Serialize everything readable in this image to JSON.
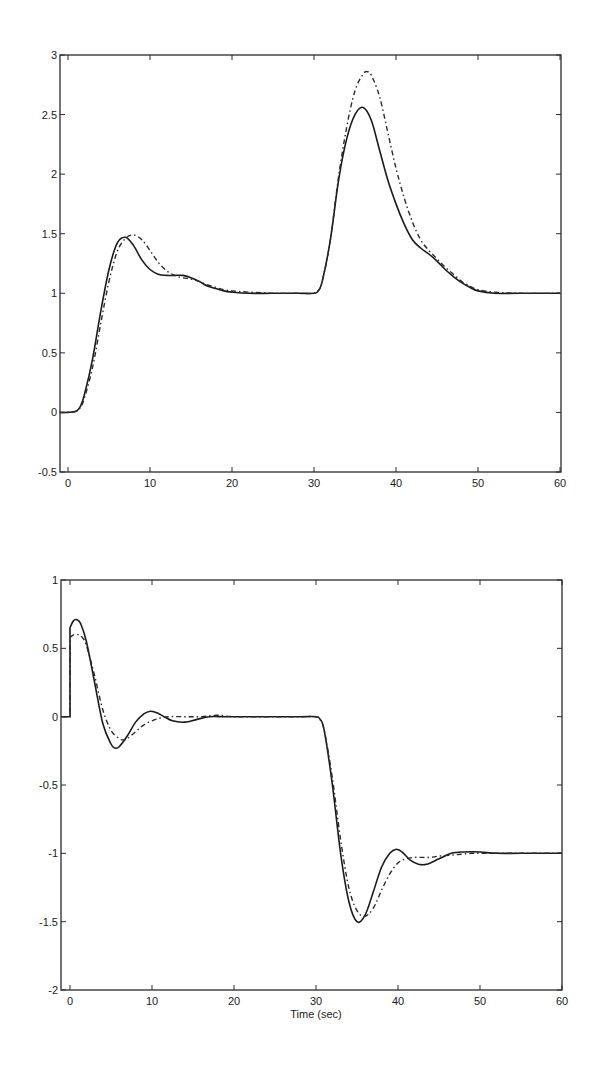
{
  "chart_data": [
    {
      "type": "line",
      "title": "",
      "xlabel": "",
      "ylabel": "",
      "xlim": [
        -1,
        60
      ],
      "ylim": [
        -0.5,
        3
      ],
      "grid": false,
      "legend": null,
      "x_ticks": [
        0,
        10,
        20,
        30,
        40,
        50,
        60
      ],
      "x_tick_labels": [
        "0",
        "10",
        "20",
        "30",
        "40",
        "50",
        "60"
      ],
      "y_ticks": [
        -0.5,
        0,
        0.5,
        1,
        1.5,
        2,
        2.5,
        3
      ],
      "y_tick_labels": [
        "-0.5",
        "0",
        "0.5",
        "1",
        "1.5",
        "2",
        "2.5",
        "3"
      ],
      "series": [
        {
          "name": "solid",
          "style": "solid",
          "x": [
            -1,
            0,
            1,
            1.5,
            2,
            3,
            4,
            5,
            6,
            7,
            8,
            9,
            10,
            11,
            12,
            13,
            14,
            15,
            16,
            17,
            18,
            19,
            20,
            22,
            25,
            28,
            30,
            30.5,
            31,
            32,
            33,
            34,
            35,
            36,
            37,
            38,
            39,
            40,
            41,
            42,
            43,
            44,
            45,
            46,
            47,
            48,
            49,
            50,
            52,
            55,
            60
          ],
          "y": [
            0,
            0,
            0.01,
            0.05,
            0.15,
            0.45,
            0.85,
            1.2,
            1.42,
            1.47,
            1.4,
            1.28,
            1.2,
            1.16,
            1.15,
            1.15,
            1.15,
            1.13,
            1.1,
            1.06,
            1.04,
            1.02,
            1.01,
            1.0,
            1.0,
            1.0,
            1.0,
            1.02,
            1.1,
            1.45,
            1.95,
            2.3,
            2.5,
            2.56,
            2.45,
            2.2,
            1.95,
            1.75,
            1.58,
            1.45,
            1.38,
            1.33,
            1.27,
            1.2,
            1.14,
            1.09,
            1.05,
            1.02,
            1.0,
            1.0,
            1.0
          ]
        },
        {
          "name": "dash-dot",
          "style": "dashed",
          "x": [
            -1,
            0,
            1,
            1.5,
            2,
            3,
            4,
            5,
            6,
            7,
            8,
            9,
            10,
            11,
            12,
            13,
            14,
            15,
            16,
            17,
            18,
            19,
            20,
            22,
            25,
            28,
            30,
            30.5,
            31,
            32,
            33,
            34,
            35,
            36,
            36.5,
            37,
            38,
            39,
            40,
            41,
            42,
            43,
            44,
            45,
            46,
            47,
            48,
            49,
            50,
            52,
            55,
            60
          ],
          "y": [
            0,
            0,
            0.01,
            0.04,
            0.12,
            0.38,
            0.75,
            1.1,
            1.35,
            1.46,
            1.49,
            1.45,
            1.36,
            1.26,
            1.19,
            1.15,
            1.13,
            1.12,
            1.1,
            1.07,
            1.05,
            1.03,
            1.02,
            1.01,
            1.0,
            1.0,
            1.0,
            1.02,
            1.1,
            1.45,
            1.98,
            2.4,
            2.7,
            2.84,
            2.86,
            2.83,
            2.65,
            2.35,
            2.05,
            1.8,
            1.6,
            1.45,
            1.36,
            1.29,
            1.22,
            1.16,
            1.1,
            1.06,
            1.03,
            1.01,
            1.0,
            1.0
          ]
        }
      ]
    },
    {
      "type": "line",
      "title": "",
      "xlabel": "Time (sec)",
      "ylabel": "",
      "xlim": [
        -1,
        60
      ],
      "ylim": [
        -2,
        1
      ],
      "grid": false,
      "legend": null,
      "x_ticks": [
        0,
        10,
        20,
        30,
        40,
        50,
        60
      ],
      "x_tick_labels": [
        "0",
        "10",
        "20",
        "30",
        "40",
        "50",
        "60"
      ],
      "y_ticks": [
        -2,
        -1.5,
        -1,
        -0.5,
        0,
        0.5,
        1
      ],
      "y_tick_labels": [
        "-2",
        "-1.5",
        "-1",
        "-0.5",
        "0",
        "0.5",
        "1"
      ],
      "series": [
        {
          "name": "solid",
          "style": "solid",
          "x": [
            -1,
            0,
            0,
            0.4,
            0.8,
            1.3,
            2,
            3,
            4,
            5,
            5.5,
            6,
            7,
            8,
            9,
            9.8,
            10.5,
            11.5,
            12.5,
            14,
            15.5,
            17,
            19,
            22,
            25,
            28,
            30,
            30.5,
            31,
            32,
            33,
            34,
            35,
            36,
            37,
            38,
            39,
            39.8,
            40.5,
            41.5,
            42.5,
            43.5,
            45,
            46.5,
            48,
            50,
            52,
            55,
            60
          ],
          "y": [
            0,
            0,
            0.65,
            0.7,
            0.71,
            0.68,
            0.55,
            0.25,
            -0.05,
            -0.2,
            -0.23,
            -0.22,
            -0.14,
            -0.04,
            0.02,
            0.04,
            0.03,
            0.0,
            -0.03,
            -0.04,
            -0.02,
            0.0,
            0.0,
            0.0,
            0.0,
            0.0,
            0.0,
            -0.02,
            -0.1,
            -0.5,
            -1.0,
            -1.35,
            -1.5,
            -1.45,
            -1.28,
            -1.1,
            -1.0,
            -0.97,
            -0.99,
            -1.05,
            -1.08,
            -1.08,
            -1.04,
            -1.0,
            -0.99,
            -0.99,
            -1.0,
            -1.0,
            -1.0
          ]
        },
        {
          "name": "dash-dot",
          "style": "dashed",
          "x": [
            -1,
            0,
            0,
            0.5,
            1,
            1.5,
            2,
            3,
            4,
            5,
            6,
            6.5,
            7,
            8,
            9,
            10,
            11,
            12,
            14,
            16,
            18,
            20,
            25,
            28,
            30,
            30.5,
            31,
            32,
            33,
            34,
            35,
            36,
            37,
            38,
            39,
            40,
            41,
            42,
            43,
            44,
            45,
            47,
            49,
            50,
            55,
            60
          ],
          "y": [
            0,
            0,
            0.58,
            0.6,
            0.6,
            0.58,
            0.52,
            0.3,
            0.05,
            -0.1,
            -0.16,
            -0.17,
            -0.16,
            -0.11,
            -0.06,
            -0.03,
            -0.01,
            0.0,
            0.0,
            0.0,
            0.01,
            0.0,
            0.0,
            0.0,
            0.0,
            -0.02,
            -0.1,
            -0.45,
            -0.9,
            -1.25,
            -1.42,
            -1.46,
            -1.4,
            -1.27,
            -1.15,
            -1.07,
            -1.04,
            -1.03,
            -1.03,
            -1.03,
            -1.02,
            -1.01,
            -1.0,
            -1.0,
            -1.0,
            -1.0
          ]
        }
      ]
    }
  ]
}
